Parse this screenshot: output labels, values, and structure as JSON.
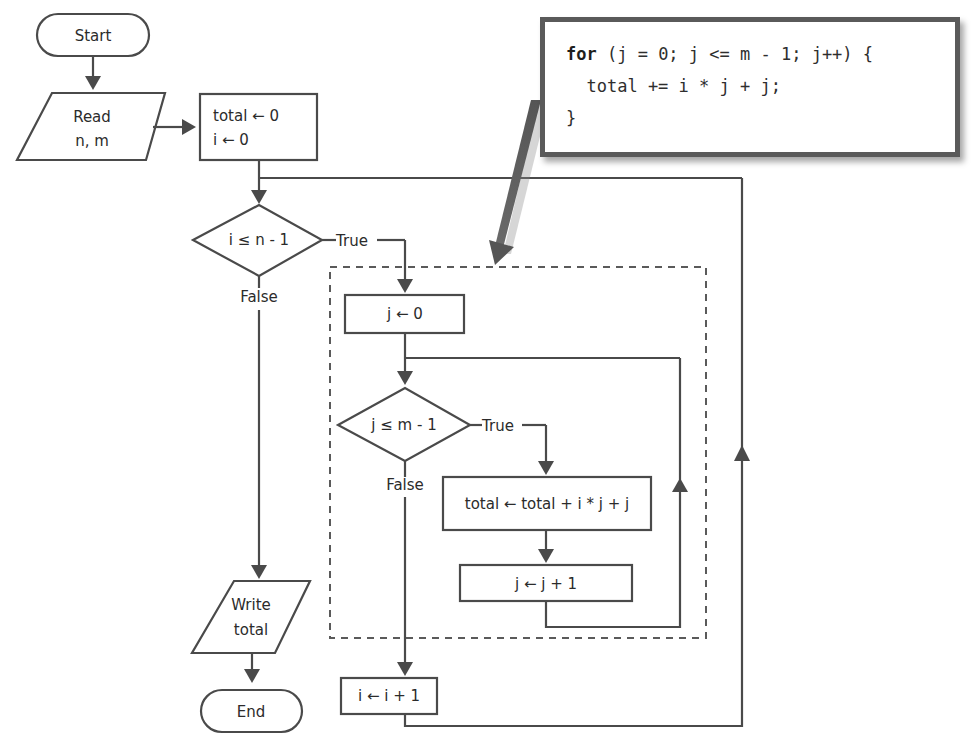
{
  "diagram": {
    "type": "flowchart",
    "nodes": {
      "start": "Start",
      "read": [
        "Read",
        "n, m"
      ],
      "init": [
        "total  ← 0",
        "i ← 0"
      ],
      "outer_cond": "i ≤ n - 1",
      "outer_true": "True",
      "outer_false": "False",
      "j_init": "j ← 0",
      "inner_cond": "j ≤ m - 1",
      "inner_true": "True",
      "inner_false": "False",
      "body": "total ← total + i * j + j",
      "j_inc": "j ← j + 1",
      "i_inc": "i ← i + 1",
      "write": [
        "Write",
        "total"
      ],
      "end": "End"
    },
    "code_callout": {
      "keyword": "for",
      "line1_rest": " (j = 0; j <= m - 1; j++) {",
      "line2": "  total += i * j + j;",
      "line3": "}"
    }
  }
}
